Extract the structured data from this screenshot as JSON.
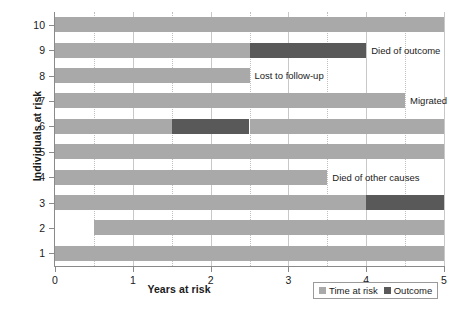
{
  "chart_data": {
    "type": "bar",
    "title": "",
    "xlabel": "Years at risk",
    "ylabel": "Individuals at risk",
    "xlim": [
      0,
      5
    ],
    "ylim": [
      0.5,
      10.5
    ],
    "xticks": [
      "0",
      "1",
      "2",
      "3",
      "4",
      "5"
    ],
    "xtick_values": [
      0,
      1,
      2,
      3,
      4,
      5
    ],
    "minor_gridlines": [
      0.5,
      1.5,
      2.5,
      3.5,
      4.5
    ],
    "yticks": [
      "1",
      "2",
      "3",
      "4",
      "5",
      "6",
      "7",
      "8",
      "9",
      "10"
    ],
    "ytick_values": [
      1,
      2,
      3,
      4,
      5,
      6,
      7,
      8,
      9,
      10
    ],
    "grid": true,
    "orientation": "horizontal",
    "legend_position": "bottom-right",
    "series": [
      {
        "name": "Time at risk",
        "color": "#a9a9a9"
      },
      {
        "name": "Outcome",
        "color": "#595959"
      }
    ],
    "rows": [
      {
        "id": 10,
        "segments": [
          {
            "series": "Time at risk",
            "start": 0,
            "end": 5
          }
        ],
        "annotation": ""
      },
      {
        "id": 9,
        "segments": [
          {
            "series": "Time at risk",
            "start": 0,
            "end": 2.5
          },
          {
            "series": "Outcome",
            "start": 2.5,
            "end": 4.0
          }
        ],
        "annotation": "Died of outcome"
      },
      {
        "id": 8,
        "segments": [
          {
            "series": "Time at risk",
            "start": 0,
            "end": 2.5
          }
        ],
        "annotation": "Lost to follow-up"
      },
      {
        "id": 7,
        "segments": [
          {
            "series": "Time at risk",
            "start": 0,
            "end": 4.5
          }
        ],
        "annotation": "Migrated"
      },
      {
        "id": 6,
        "segments": [
          {
            "series": "Time at risk",
            "start": 0,
            "end": 1.5
          },
          {
            "series": "Outcome",
            "start": 1.5,
            "end": 2.5
          },
          {
            "series": "Time at risk",
            "start": 2.5,
            "end": 5
          }
        ],
        "annotation": ""
      },
      {
        "id": 5,
        "segments": [
          {
            "series": "Time at risk",
            "start": 0,
            "end": 5
          }
        ],
        "annotation": ""
      },
      {
        "id": 4,
        "segments": [
          {
            "series": "Time at risk",
            "start": 0,
            "end": 3.5
          }
        ],
        "annotation": "Died of other causes"
      },
      {
        "id": 3,
        "segments": [
          {
            "series": "Time at risk",
            "start": 0,
            "end": 4.0
          },
          {
            "series": "Outcome",
            "start": 4.0,
            "end": 5
          }
        ],
        "annotation": ""
      },
      {
        "id": 2,
        "segments": [
          {
            "series": "Time at risk",
            "start": 0.5,
            "end": 5
          }
        ],
        "annotation": ""
      },
      {
        "id": 1,
        "segments": [
          {
            "series": "Time at risk",
            "start": 0,
            "end": 5
          }
        ],
        "annotation": ""
      }
    ]
  },
  "legend": {
    "items": [
      {
        "label": "Time at risk",
        "color": "#a9a9a9"
      },
      {
        "label": "Outcome",
        "color": "#595959"
      }
    ]
  }
}
